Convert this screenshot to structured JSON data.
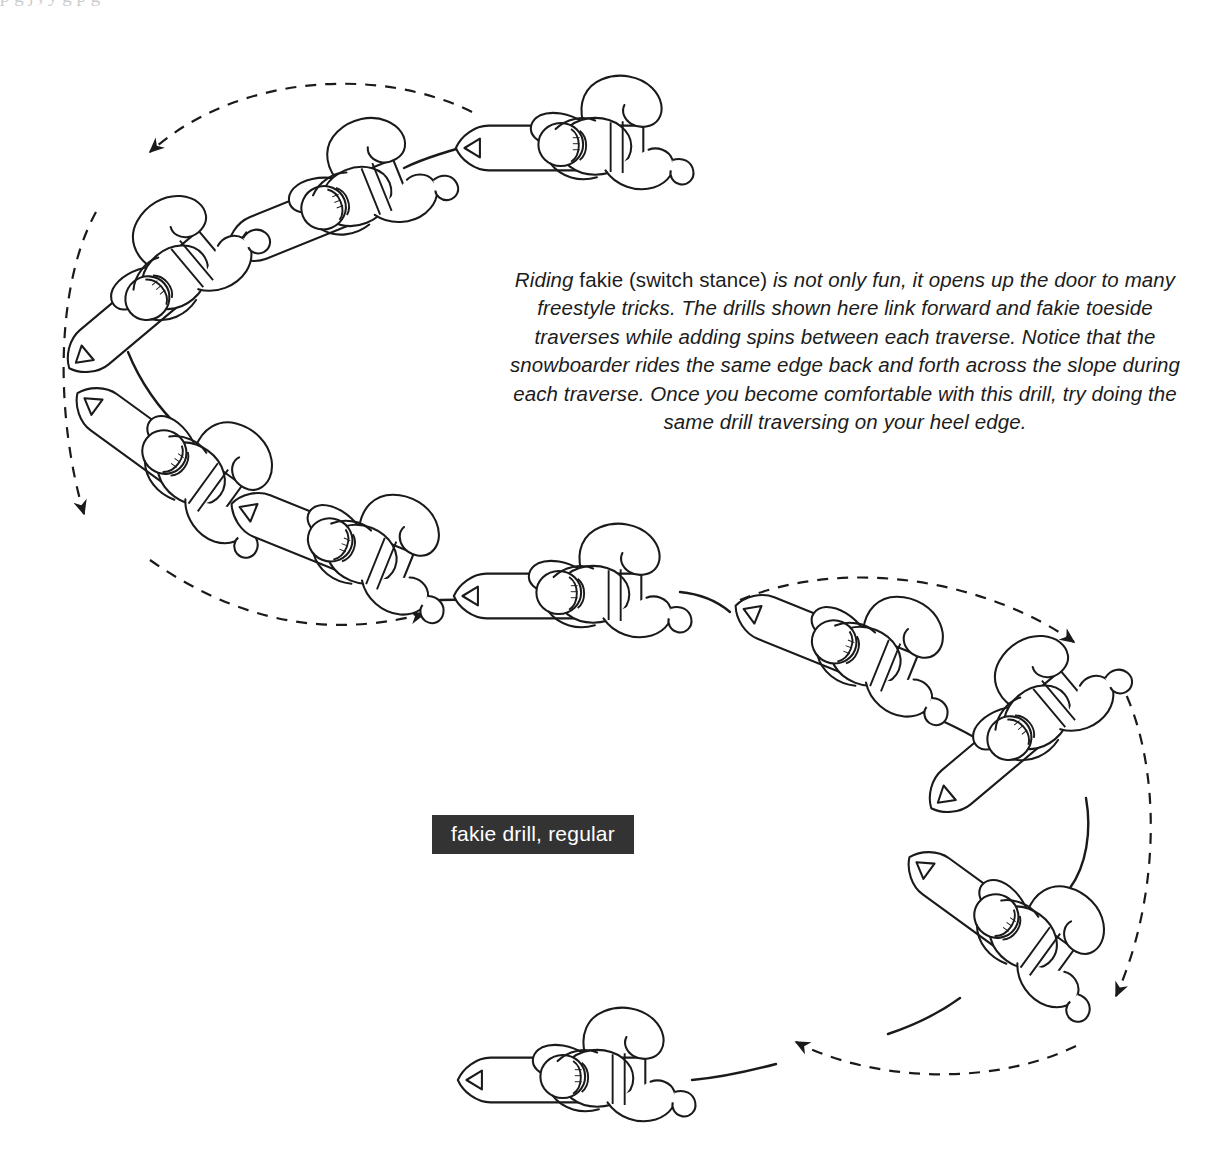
{
  "figure": {
    "caption_label": "fakie drill, regular",
    "caption_bg_color": "#333333",
    "caption_text_color": "#ffffff",
    "line_color": "#1a1a1a",
    "background_color": "#ffffff",
    "top_scan_artifact": "p    g  j       ,     y  g    p    g",
    "body_text_parts": {
      "lead_italic": "Riding ",
      "upright_phrase": "fakie (switch stance)",
      "rest_italic": " is not only fun, it opens up the door to many freestyle tricks. The drills shown here link forward and fakie toeside traverses while adding spins between each traverse. Notice that the snowboarder rides the same edge back and forth across the slope during each traverse. Once you become comfortable with this drill, try doing the same drill traversing on your heel edge."
    },
    "body_text_full": "Riding fakie (switch stance) is not only fun, it opens up the door to many freestyle tricks. The drills shown here link forward and fakie toeside traverses while adding spins between each traverse. Notice that the snowboarder rides the same edge back and forth across the slope during each traverse. Once you become comfortable with this drill, try doing the same drill traversing on your heel edge."
  },
  "diagram": {
    "type": "instructional-sequence",
    "riders_count": 10,
    "riders": [
      {
        "id": "rider-1",
        "label": "rider-top-right",
        "x": 590,
        "y": 148,
        "rotation": 0,
        "nose_direction": "left"
      },
      {
        "id": "rider-2",
        "label": "rider-upper-mid-left",
        "x": 352,
        "y": 200,
        "rotation": -22,
        "nose_direction": "left"
      },
      {
        "id": "rider-3",
        "label": "rider-upper-left",
        "x": 170,
        "y": 280,
        "rotation": -38,
        "nose_direction": "down-left"
      },
      {
        "id": "rider-4",
        "label": "rider-mid-left-upper",
        "x": 182,
        "y": 470,
        "rotation": 35,
        "nose_direction": "up-right"
      },
      {
        "id": "rider-5",
        "label": "rider-mid-left-lower",
        "x": 352,
        "y": 552,
        "rotation": 22,
        "nose_direction": "up-left"
      },
      {
        "id": "rider-6",
        "label": "rider-center",
        "x": 588,
        "y": 595,
        "rotation": 0,
        "nose_direction": "left"
      },
      {
        "id": "rider-7",
        "label": "rider-right-upper",
        "x": 858,
        "y": 655,
        "rotation": 22,
        "nose_direction": "left"
      },
      {
        "id": "rider-8",
        "label": "rider-right-mid",
        "x": 1035,
        "y": 720,
        "rotation": -38,
        "nose_direction": "up-right"
      },
      {
        "id": "rider-9",
        "label": "rider-right-lower",
        "x": 1020,
        "y": 935,
        "rotation": 35,
        "nose_direction": "down-right"
      },
      {
        "id": "rider-10",
        "label": "rider-bottom",
        "x": 590,
        "y": 1080,
        "rotation": 0,
        "nose_direction": "left"
      }
    ],
    "dashed_arcs": [
      {
        "id": "arc-top",
        "label": "spin-arc-top-left",
        "direction": "leftward",
        "arrowhead": "left"
      },
      {
        "id": "arc-left",
        "label": "spin-arc-left",
        "direction": "downward",
        "arrowhead": "down"
      },
      {
        "id": "arc-center",
        "label": "spin-arc-center",
        "direction": "rightward",
        "arrowhead": "right"
      },
      {
        "id": "arc-right-top",
        "label": "spin-arc-right-top",
        "direction": "rightward",
        "arrowhead": "right"
      },
      {
        "id": "arc-right",
        "label": "spin-arc-right",
        "direction": "downward",
        "arrowhead": "down"
      },
      {
        "id": "arc-bottom",
        "label": "spin-arc-bottom",
        "direction": "leftward",
        "arrowhead": "left"
      }
    ]
  }
}
